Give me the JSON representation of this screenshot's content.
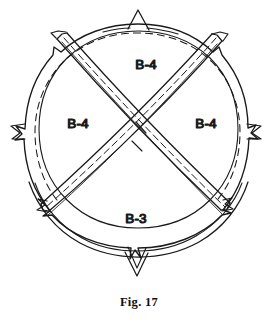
{
  "figure": {
    "caption": "Fig. 17",
    "type": "patent-line-drawing",
    "stroke_color": "#1a1a1a",
    "background_color": "#ffffff",
    "labels": [
      {
        "id": "label-top",
        "text": "B-4",
        "x": 146,
        "y": 65,
        "sector": "top"
      },
      {
        "id": "label-left",
        "text": "B-4",
        "x": 78,
        "y": 124,
        "sector": "left"
      },
      {
        "id": "label-right",
        "text": "B-4",
        "x": 206,
        "y": 124,
        "sector": "right"
      },
      {
        "id": "label-bottom",
        "text": "B-3",
        "x": 136,
        "y": 219,
        "sector": "bottom"
      }
    ],
    "geometry": {
      "center_x": 138,
      "center_y": 142,
      "rim_outer_radius": 118,
      "rim_inner_radius": 112,
      "dashed_radius": 103,
      "strap_half_width": 7,
      "tab_count": 4,
      "tab_positions": [
        "top",
        "left",
        "right",
        "bottom"
      ],
      "strap_count": 2,
      "sector_count": 4
    }
  }
}
